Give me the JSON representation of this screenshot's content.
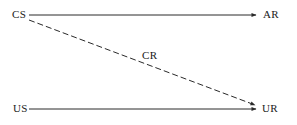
{
  "diagram": {
    "nodes": [
      {
        "id": "cs",
        "label": "CS"
      },
      {
        "id": "ar",
        "label": "AR"
      },
      {
        "id": "us",
        "label": "US"
      },
      {
        "id": "ur",
        "label": "UR"
      }
    ],
    "edges": [
      {
        "from": "CS",
        "to": "AR",
        "style": "solid"
      },
      {
        "from": "CS",
        "to": "UR",
        "style": "dashed",
        "label": "CR"
      },
      {
        "from": "US",
        "to": "UR",
        "style": "solid"
      }
    ],
    "labels": {
      "cs": "CS",
      "ar": "AR",
      "us": "US",
      "ur": "UR",
      "cr": "CR"
    },
    "colors": {
      "line": "#2a2a2a",
      "text": "#1a1a1a",
      "background": "#ffffff"
    }
  }
}
